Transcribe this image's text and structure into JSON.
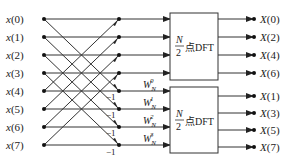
{
  "diagram": {
    "title": "",
    "type": "8-point DIT/DIF FFT butterfly (first stage, decimation in frequency)",
    "inputs": [
      "x(0)",
      "x(1)",
      "x(2)",
      "x(3)",
      "x(4)",
      "x(5)",
      "x(6)",
      "x(7)"
    ],
    "outputs_top": [
      "X(0)",
      "X(2)",
      "X(4)",
      "X(6)"
    ],
    "outputs_bottom": [
      "X(1)",
      "X(3)",
      "X(5)",
      "X(7)"
    ],
    "twiddles": [
      {
        "base": "W",
        "sub": "N",
        "sup": "0"
      },
      {
        "base": "W",
        "sub": "N",
        "sup": "1"
      },
      {
        "base": "W",
        "sub": "N",
        "sup": "2"
      },
      {
        "base": "W",
        "sub": "N",
        "sup": "3"
      }
    ],
    "minus_one": "−1",
    "blocks": [
      {
        "numerator": "N",
        "denominator": "2",
        "label": "点DFT"
      },
      {
        "numerator": "N",
        "denominator": "2",
        "label": "点DFT"
      }
    ],
    "colors": {
      "line": "#333333",
      "node": "#111111",
      "text": "#222222",
      "background": "#ffffff"
    }
  }
}
